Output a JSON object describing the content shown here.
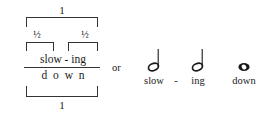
{
  "figure": {
    "metrical_diagram": {
      "top_level_label": "1",
      "mid_level_labels": [
        "½",
        "½"
      ],
      "syllable_tier": "slow - ing",
      "syllables": [
        "slow",
        "-",
        "ing"
      ],
      "segment_tier": [
        "d",
        "o",
        "w",
        "n"
      ],
      "bottom_level_label": "1"
    },
    "connector": {
      "label": "or"
    },
    "music_notation": {
      "notes": [
        {
          "glyph": "half-note",
          "duration": "half",
          "lyric": "slow"
        },
        {
          "glyph": "half-note",
          "duration": "half",
          "lyric": "ing"
        },
        {
          "glyph": "whole-note",
          "duration": "whole",
          "lyric": "down"
        }
      ],
      "hyphen": "-"
    },
    "colors": {
      "ink": "#1a1a1a",
      "rule": "#333333",
      "background": "#ffffff"
    }
  }
}
